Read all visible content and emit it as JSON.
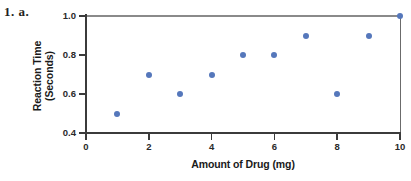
{
  "problem_label": "1. a.",
  "chart_data": {
    "type": "scatter",
    "title": "",
    "xlabel": "Amount of Drug (mg)",
    "ylabel": "Reaction Time (Seconds)",
    "ylabel_lines": [
      "Reaction Time",
      "(Seconds)"
    ],
    "x": [
      1,
      2,
      3,
      4,
      5,
      6,
      7,
      8,
      9,
      10
    ],
    "values": [
      0.5,
      0.7,
      0.6,
      0.7,
      0.8,
      0.8,
      0.9,
      0.6,
      0.9,
      1.0
    ],
    "points": [
      {
        "x": 1,
        "y": 0.5
      },
      {
        "x": 2,
        "y": 0.7
      },
      {
        "x": 3,
        "y": 0.6
      },
      {
        "x": 4,
        "y": 0.7
      },
      {
        "x": 5,
        "y": 0.8
      },
      {
        "x": 6,
        "y": 0.8
      },
      {
        "x": 7,
        "y": 0.9
      },
      {
        "x": 8,
        "y": 0.6
      },
      {
        "x": 9,
        "y": 0.9
      },
      {
        "x": 10,
        "y": 1.0
      }
    ],
    "xlim": [
      0,
      10
    ],
    "ylim": [
      0.4,
      1.0
    ],
    "xticks": [
      0,
      2,
      4,
      6,
      8,
      10
    ],
    "xtick_labels": [
      "0",
      "2",
      "4",
      "6",
      "8",
      "10"
    ],
    "yticks": [
      0.4,
      0.6,
      0.8,
      1.0
    ],
    "ytick_labels": [
      "0.4",
      "0.6",
      "0.8",
      "1.0"
    ],
    "grid": false,
    "legend": false,
    "marker_color": "#5577bb",
    "axis_color": "#3b3b3b",
    "frame_color": "#8a8a8a",
    "text_color": "#1a1a1a",
    "background": "#ffffff"
  }
}
